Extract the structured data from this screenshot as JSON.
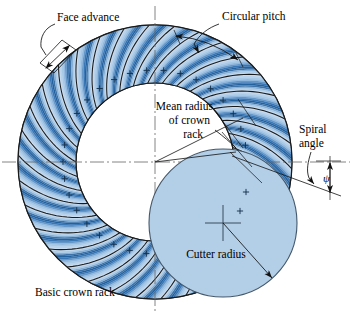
{
  "figure": {
    "title_implicit": "Basic crown rack and cutter geometry",
    "labels": {
      "face_advance": "Face advance",
      "circular_pitch": "Circular pitch",
      "mean_radius_line1": "Mean radius",
      "mean_radius_line2": "of crown",
      "mean_radius_line3": "rack",
      "spiral_angle_line1": "Spiral",
      "spiral_angle_line2": "angle",
      "spiral_angle_symbol": "ψ",
      "cutter_radius": "Cutter radius",
      "basic_crown_rack": "Basic crown rack"
    },
    "colors": {
      "tooth_light": "#cfe0f2",
      "tooth_mid": "#9cc1e2",
      "tooth_dark": "#2e6fb0",
      "tooth_deep": "#1b5893",
      "cutter_fill": "#b3cfe8",
      "outline": "#1a1a1a",
      "cutter_outline": "#44586b",
      "centerline": "#555555",
      "leader": "#222222",
      "page_bg": "#ffffff"
    },
    "geometry": {
      "ring_center_x": 155,
      "ring_center_y": 162,
      "ring_outer_radius": 137,
      "ring_inner_radius": 79,
      "tooth_count": 34,
      "cutter_center_x": 223,
      "cutter_center_y": 223,
      "cutter_radius": 74,
      "spiral_angle_degrees": 20
    },
    "icons": {
      "plus_mark": "plus-tick-mark",
      "center_mark": "center-crosshair-mark"
    }
  }
}
